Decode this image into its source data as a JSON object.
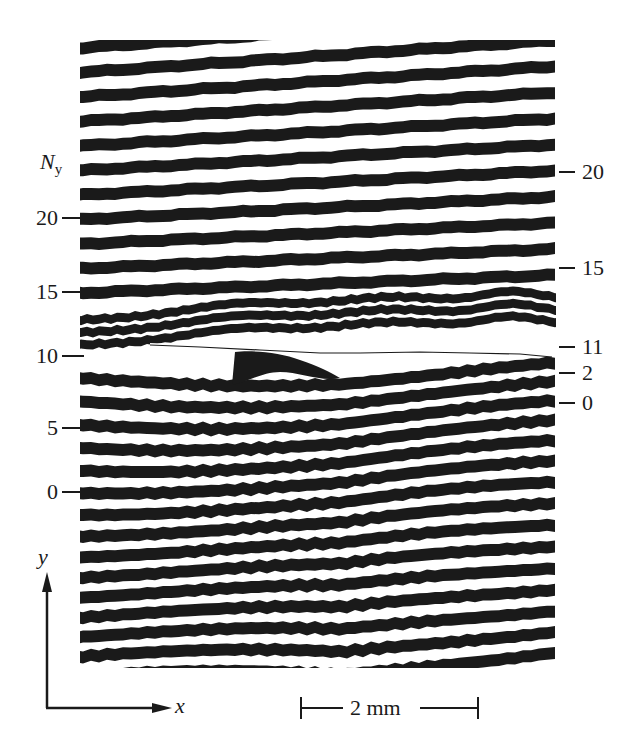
{
  "figure": {
    "type": "moire fringe pattern (interferometric displacement field)",
    "fringe_color": "#1a1a1a",
    "background_color": "#ffffff",
    "pattern_region": {
      "x0": 80,
      "y0": 40,
      "x1": 556,
      "y1": 668
    }
  },
  "left_axis": {
    "title_main": "N",
    "title_sub": "y",
    "ticks": [
      {
        "label": "20",
        "y": 218
      },
      {
        "label": "15",
        "y": 292
      },
      {
        "label": "10",
        "y": 356
      },
      {
        "label": "5",
        "y": 428
      },
      {
        "label": "0",
        "y": 492
      }
    ]
  },
  "right_axis": {
    "ticks": [
      {
        "label": "20",
        "y": 172
      },
      {
        "label": "15",
        "y": 268
      },
      {
        "label": "11",
        "y": 347
      },
      {
        "label": "2",
        "y": 373
      },
      {
        "label": "0",
        "y": 403
      }
    ]
  },
  "coordinate_axes": {
    "y_label": "y",
    "x_label": "x"
  },
  "scale_bar": {
    "label": "2 mm"
  },
  "crack_line": {
    "y": 348,
    "x_start": 150,
    "x_end": 550
  }
}
